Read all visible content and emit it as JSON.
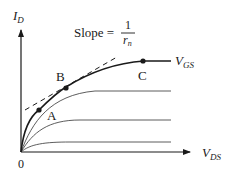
{
  "diagram": {
    "type": "mosfet-output-characteristics",
    "y_axis_label": {
      "main": "I",
      "sub": "D"
    },
    "x_axis_label": {
      "main": "V",
      "sub": "DS"
    },
    "origin_label": "0",
    "slope_annotation": {
      "prefix": "Slope =",
      "numerator": "1",
      "denominator_main": "r",
      "denominator_sub": "n"
    },
    "curve_label": {
      "main": "V",
      "sub": "GS"
    },
    "points": [
      {
        "label": "A"
      },
      {
        "label": "B"
      },
      {
        "label": "C"
      }
    ],
    "curves_count": 4,
    "colors": {
      "ink": "#1a1a1a",
      "background": "#ffffff"
    }
  }
}
